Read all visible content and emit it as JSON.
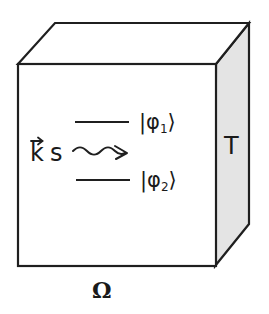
{
  "diagram": {
    "type": "3d-box-schematic",
    "colors": {
      "stroke": "#1f1f1f",
      "front_face": "#ffffff",
      "top_face": "#ffffff",
      "side_face": "#e4e4e4",
      "text": "#1a1a1a"
    },
    "box": {
      "front_face_label": "",
      "side_face_label": "T",
      "bottom_label": "Ω"
    },
    "incoming_wave": {
      "vector_symbol": "k",
      "vector_arrow": "→",
      "suffix": "s",
      "arrow_style": "wavy"
    },
    "levels": [
      {
        "name": "upper-level",
        "ket_open": "|φ",
        "index": "1",
        "ket_close": "⟩"
      },
      {
        "name": "lower-level",
        "ket_open": "|φ",
        "index": "2",
        "ket_close": "⟩"
      }
    ]
  }
}
